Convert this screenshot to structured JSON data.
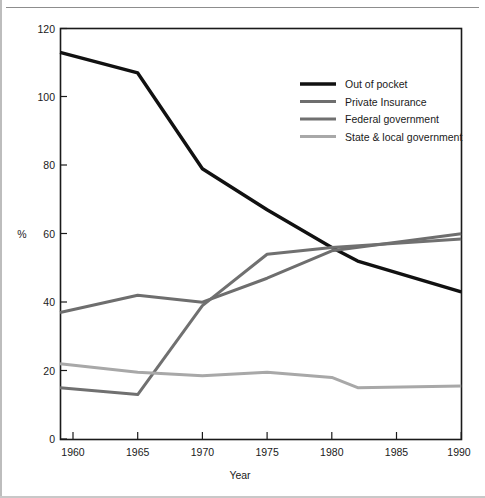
{
  "figure": {
    "ylabel": "%",
    "xlabel": "Year"
  },
  "chart_data": {
    "type": "line",
    "title": "",
    "subtitle": "",
    "xlabel": "Year",
    "ylabel": "%",
    "xlim": [
      1959,
      1991
    ],
    "ylim": [
      0,
      120
    ],
    "yticks": [
      0,
      20,
      40,
      60,
      80,
      100,
      120
    ],
    "xticks": [
      1960,
      1965,
      1970,
      1975,
      1980,
      1985,
      1990
    ],
    "grid": false,
    "legend_position": "upper right",
    "series": [
      {
        "name": "Out of pocket",
        "color": "#111111",
        "x": [
          1959,
          1965,
          1970,
          1975,
          1980,
          1982,
          1990
        ],
        "values": [
          113,
          107,
          79,
          67,
          56,
          52,
          43
        ]
      },
      {
        "name": "Private Insurance",
        "color": "#6e6e6e",
        "x": [
          1959,
          1965,
          1970,
          1975,
          1980,
          1990
        ],
        "values": [
          37,
          42,
          40,
          47,
          55,
          60
        ]
      },
      {
        "name": "Federal government",
        "color": "#707070",
        "x": [
          1959,
          1965,
          1970,
          1975,
          1980,
          1990
        ],
        "values": [
          15,
          13,
          39,
          54,
          56,
          58.5
        ]
      },
      {
        "name": "State & local government",
        "color": "#a8a8a8",
        "x": [
          1959,
          1965,
          1970,
          1975,
          1980,
          1982,
          1990
        ],
        "values": [
          22,
          19.5,
          18.5,
          19.5,
          18,
          15,
          15.5
        ]
      }
    ]
  },
  "yticks": {
    "t0": "0",
    "t20": "20",
    "t40": "40",
    "t60": "60",
    "t80": "80",
    "t100": "100",
    "t120": "120"
  },
  "xticks": {
    "t1960": "1960",
    "t1965": "1965",
    "t1970": "1970",
    "t1975": "1975",
    "t1980": "1980",
    "t1985": "1985",
    "t1990": "1990"
  },
  "legend": {
    "items": [
      {
        "label": "Out of pocket",
        "color": "#111111"
      },
      {
        "label": "Private Insurance",
        "color": "#6e6e6e"
      },
      {
        "label": "Federal government",
        "color": "#707070"
      },
      {
        "label": "State & local government",
        "color": "#a8a8a8"
      }
    ]
  }
}
